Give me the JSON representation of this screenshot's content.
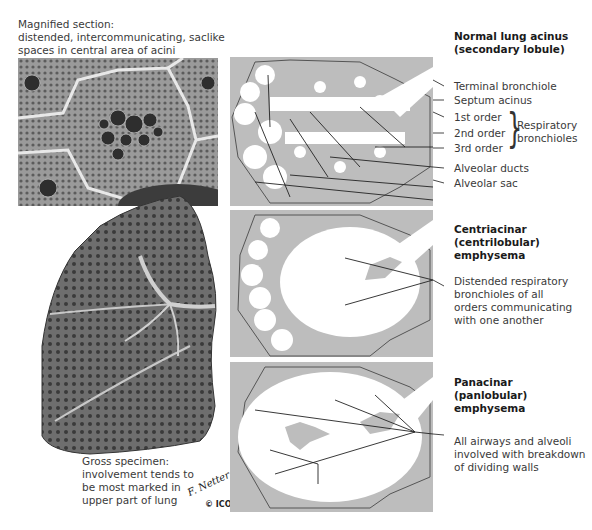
{
  "magnified_caption": {
    "lines": [
      "Magnified section:",
      "distended, intercommunicating, saclike",
      "spaces in central area of acini"
    ]
  },
  "gross_caption": {
    "lines": [
      "Gross specimen:",
      "involvement tends to",
      "be most marked in",
      "upper part of lung"
    ]
  },
  "signature": {
    "artist": "F. Netter",
    "copyright": "© ICON"
  },
  "panels": [
    {
      "title_lines": [
        "Normal lung acinus",
        "(secondary lobule)"
      ],
      "labels": [
        "Terminal bronchiole",
        "Septum acinus",
        "1st order",
        "2nd order",
        "3rd order",
        "Alveolar ducts",
        "Alveolar sac"
      ],
      "bracket_label_lines": [
        "Respiratory",
        "bronchioles"
      ]
    },
    {
      "title_lines": [
        "Centriacinar",
        "(centrilobular)",
        "emphysema"
      ],
      "description_lines": [
        "Distended respiratory",
        "bronchioles of all",
        "orders communicating",
        "with one another"
      ]
    },
    {
      "title_lines": [
        "Panacinar",
        "(panlobular)",
        "emphysema"
      ],
      "description_lines": [
        "All airways and alveoli",
        "involved with breakdown",
        "of dividing walls"
      ]
    }
  ],
  "colors": {
    "panel_bg": "#bdbdbd",
    "acinus_fill": "#ffffff",
    "outline": "#555555"
  }
}
